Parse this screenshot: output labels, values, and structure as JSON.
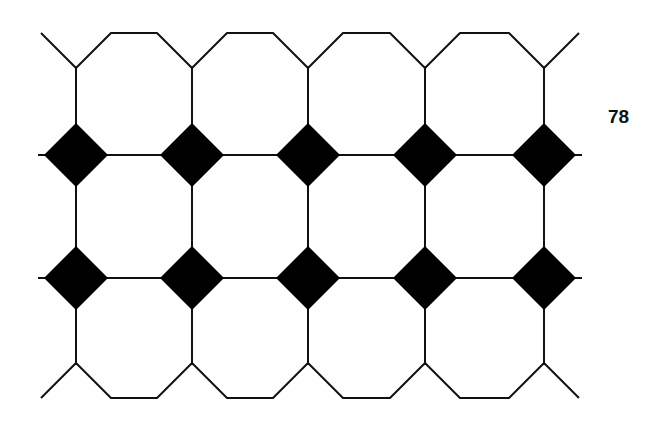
{
  "figure": {
    "page_number": "78",
    "colors": {
      "line": "#111111",
      "diamond_fill": "#000000",
      "background": "#ffffff"
    },
    "grid": {
      "columns_x": [
        76,
        192,
        308,
        425,
        544
      ],
      "rows_y": [
        155,
        278
      ],
      "top_edge_y": 33,
      "bottom_edge_y": 398,
      "diamond_half_size": 32,
      "octagon_top_vertex_y": 68,
      "octagon_bottom_vertex_y": 363
    }
  }
}
